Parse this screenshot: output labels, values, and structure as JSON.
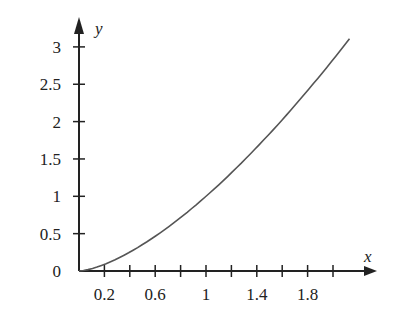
{
  "chart_data": {
    "type": "line",
    "title": "",
    "xlabel": "x",
    "ylabel": "y",
    "x_tick_labels": [
      "0.2",
      "0.6",
      "1",
      "1.4",
      "1.8"
    ],
    "x_ticks": [
      0.2,
      0.4,
      0.6,
      0.8,
      1.0,
      1.2,
      1.4,
      1.6,
      1.8,
      2.0
    ],
    "y_tick_labels": [
      "0",
      "0.5",
      "1",
      "1.5",
      "2",
      "2.5",
      "3"
    ],
    "y_ticks": [
      0,
      0.5,
      1,
      1.5,
      2,
      2.5,
      3
    ],
    "xlim": [
      0,
      2.3
    ],
    "ylim": [
      0,
      3.3
    ],
    "grid": false,
    "series": [
      {
        "name": "curve",
        "x": [
          0,
          0.2,
          0.4,
          0.6,
          0.8,
          1.0,
          1.2,
          1.4,
          1.6,
          1.8,
          2.0,
          2.13
        ],
        "values": [
          0,
          0.09,
          0.25,
          0.46,
          0.72,
          1.0,
          1.31,
          1.66,
          2.02,
          2.41,
          2.83,
          3.1
        ]
      }
    ]
  }
}
